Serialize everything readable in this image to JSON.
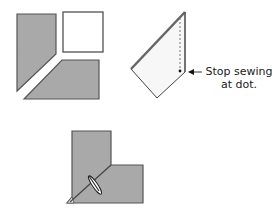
{
  "diagram": {
    "colors": {
      "fabric_fill": "#a9a9a9",
      "fabric_stroke": "#555555",
      "light_fill": "#f7f7f7",
      "white_fill": "#ffffff",
      "outline": "#333333"
    },
    "steps": [
      {
        "id": "step-1",
        "description": "Pieces laid out: two trapezoid strips and a square"
      },
      {
        "id": "step-2",
        "description": "Folded piece with dashed stitch line"
      },
      {
        "id": "step-3",
        "description": "Joined L-shape with pressed seam"
      }
    ],
    "annotation": {
      "line1": "Stop sewing",
      "line2": "at dot."
    }
  }
}
